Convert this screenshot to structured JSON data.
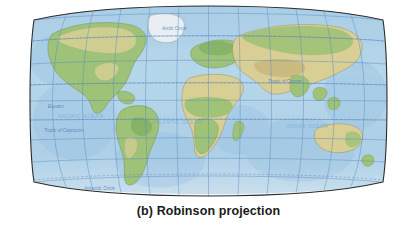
{
  "figure": {
    "caption": "(b) Robinson projection",
    "panel_letter": "(b)",
    "projection_name": "Robinson projection"
  },
  "map": {
    "type": "world-map",
    "projection": "Robinson",
    "background_color": "#ffffff",
    "ocean_color": "#b4d3e8",
    "ocean_deep_color": "#9dc6e2",
    "land_green_color": "#9ec278",
    "land_tan_color": "#d9cf96",
    "land_dark_green_color": "#7fae63",
    "ice_color": "#eef4f8",
    "graticule_color": "#5a8cc0",
    "border_color": "#2b2b2b",
    "graticule_labels": [
      {
        "name": "arctic-circle",
        "text": "Arctic Circle"
      },
      {
        "name": "tropic-of-cancer",
        "text": "Tropic of Cancer"
      },
      {
        "name": "equator",
        "text": "Equator"
      },
      {
        "name": "tropic-of-capricorn",
        "text": "Tropic of Capricorn"
      },
      {
        "name": "antarctic-circle",
        "text": "Antarctic Circle"
      }
    ],
    "ocean_labels": [
      {
        "name": "pacific-ocean",
        "text": "PACIFIC OCEAN"
      },
      {
        "name": "atlantic-ocean",
        "text": "ATLANTIC OCEAN"
      },
      {
        "name": "indian-ocean",
        "text": "INDIAN OCEAN"
      }
    ],
    "continents": [
      {
        "name": "north-america"
      },
      {
        "name": "south-america"
      },
      {
        "name": "africa"
      },
      {
        "name": "europe"
      },
      {
        "name": "asia"
      },
      {
        "name": "australia"
      },
      {
        "name": "antarctica"
      },
      {
        "name": "greenland"
      }
    ]
  }
}
